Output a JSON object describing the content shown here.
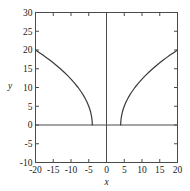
{
  "chart_data": {
    "type": "line",
    "title": "",
    "xlabel": "x",
    "ylabel": "y",
    "xlim": [
      -20,
      20
    ],
    "ylim": [
      -10,
      30
    ],
    "grid": false,
    "legend": null,
    "xticks": [
      -20,
      -15,
      -10,
      -5,
      0,
      5,
      10,
      15,
      20
    ],
    "xtick_labels": [
      "-20",
      "-15",
      "-10",
      "-5",
      "0",
      "5",
      "10",
      "15",
      "20"
    ],
    "yticks": [
      -10,
      -5,
      0,
      5,
      10,
      15,
      20,
      25,
      30
    ],
    "ytick_labels": [
      "-10",
      "-5",
      "0",
      "5",
      "10",
      "15",
      "20",
      "25",
      "30"
    ],
    "line_color": "#3a3a3a",
    "axis_color": "#4a4a4a",
    "series": [
      {
        "name": "left-branch",
        "x": [
          -20,
          -19,
          -18,
          -17,
          -16,
          -15,
          -14,
          -13,
          -12,
          -11,
          -10,
          -9,
          -8,
          -7,
          -6.5,
          -6,
          -5.5,
          -5,
          -4.75,
          -4.5,
          -4.25,
          -4.1,
          -4.02,
          -4
        ],
        "y": [
          20,
          19.36,
          18.71,
          18.03,
          17.32,
          16.58,
          15.81,
          15.0,
          14.14,
          13.23,
          12.25,
          11.18,
          10.0,
          8.66,
          7.91,
          7.07,
          6.12,
          5.0,
          4.33,
          3.54,
          2.5,
          1.58,
          0.71,
          0
        ]
      },
      {
        "name": "right-branch",
        "x": [
          4,
          4.02,
          4.1,
          4.25,
          4.5,
          4.75,
          5,
          5.5,
          6,
          6.5,
          7,
          8,
          9,
          10,
          11,
          12,
          13,
          14,
          15,
          16,
          17,
          18,
          19,
          20
        ],
        "y": [
          0,
          0.71,
          1.58,
          2.5,
          3.54,
          4.33,
          5.0,
          6.12,
          7.07,
          7.91,
          8.66,
          10.0,
          11.18,
          12.25,
          13.23,
          14.14,
          15.0,
          15.81,
          16.58,
          17.32,
          18.03,
          18.71,
          19.36,
          20
        ]
      }
    ]
  }
}
